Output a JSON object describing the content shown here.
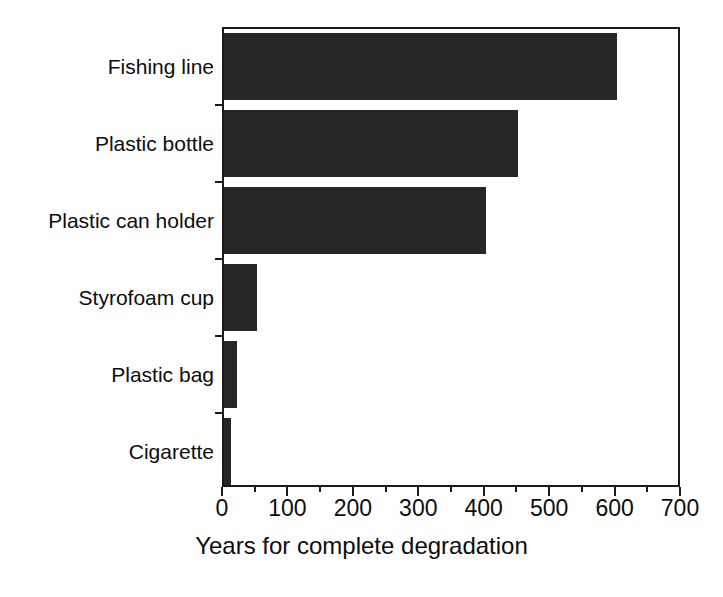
{
  "chart_data": {
    "type": "bar",
    "orientation": "horizontal",
    "title": "",
    "xlabel": "Years for complete degradation",
    "ylabel": "",
    "categories": [
      "Fishing line",
      "Plastic bottle",
      "Plastic can holder",
      "Styrofoam cup",
      "Plastic bag",
      "Cigarette"
    ],
    "values": [
      600,
      450,
      400,
      50,
      20,
      10
    ],
    "xlim": [
      0,
      700
    ],
    "xticks": [
      0,
      100,
      200,
      300,
      400,
      500,
      600,
      700
    ],
    "xtick_labels": [
      "0",
      "100",
      "200",
      "300",
      "400",
      "500",
      "600",
      "700"
    ],
    "xticks_minor": [
      50,
      150,
      250,
      350,
      450,
      550,
      650
    ],
    "grid": false,
    "legend": false,
    "bar_color": "#262626",
    "axis_color": "#1a1a1a",
    "background_color": "#ffffff"
  },
  "axis": {
    "x_title": "Years for complete degradation"
  }
}
